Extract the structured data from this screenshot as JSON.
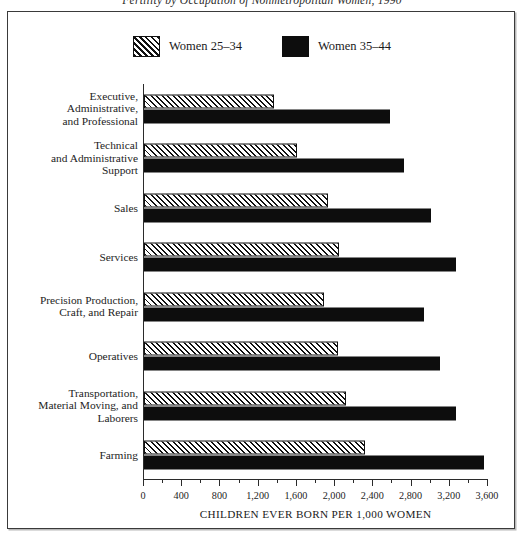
{
  "figure": {
    "title": "Fertility by Occupation of Nonmetropolitan Women, 1990",
    "axis_caption": "CHILDREN EVER BORN PER 1,000 WOMEN"
  },
  "legend": {
    "items": [
      {
        "label": "Women 25–34",
        "swatch": "hatched-swatch"
      },
      {
        "label": "Women 35–44",
        "swatch": "solid-black-swatch"
      }
    ]
  },
  "colors": {
    "bar_young_fill": "#ffffff",
    "bar_young_hatch": "#111111",
    "bar_older_fill": "#0d0d0d",
    "axis": "#2b2b2b",
    "frame": "#3a3a3a",
    "text": "#1a1a1a",
    "background": "#ffffff"
  },
  "chart_data": {
    "type": "bar",
    "orientation": "horizontal",
    "title": "Fertility by Occupation of Nonmetropolitan Women, 1990",
    "xlabel": "CHILDREN EVER BORN PER 1,000 WOMEN",
    "ylabel": "",
    "xlim": [
      0,
      3600
    ],
    "grid": false,
    "legend_position": "top-center",
    "xticks": [
      0,
      400,
      800,
      1200,
      1600,
      2000,
      2400,
      2800,
      3200,
      3600
    ],
    "xticklabels": [
      "0",
      "400",
      "800",
      "1,200",
      "1,600",
      "2,000",
      "2,400",
      "2,800",
      "3,200",
      "3,600"
    ],
    "minor_tick_interval": 200,
    "categories": [
      "Executive,\nAdministrative,\nand Professional",
      "Technical\nand Administrative\nSupport",
      "Sales",
      "Services",
      "Precision Production,\nCraft, and Repair",
      "Operatives",
      "Transportation,\nMaterial Moving, and\nLaborers",
      "Farming"
    ],
    "series": [
      {
        "name": "Women 25–34",
        "values": [
          1360,
          1600,
          1930,
          2040,
          1880,
          2030,
          2110,
          2310
        ]
      },
      {
        "name": "Women 35–44",
        "values": [
          2570,
          2720,
          3000,
          3260,
          2930,
          3100,
          3260,
          3560
        ]
      }
    ]
  }
}
